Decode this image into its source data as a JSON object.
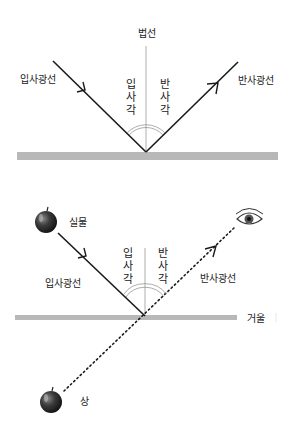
{
  "diagram_top": {
    "title": "Law of reflection",
    "normal_label": "법선",
    "incident_ray_label": "입사광선",
    "reflected_ray_label": "반사광선",
    "incident_angle_label": [
      "입",
      "사",
      "각"
    ],
    "reflected_angle_label": [
      "반",
      "사",
      "각"
    ]
  },
  "diagram_bottom": {
    "object_label": "실물",
    "image_label": "상",
    "incident_ray_label": "입사광선",
    "reflected_ray_label": "반사광선",
    "mirror_label": "거울",
    "incident_angle_label": [
      "입",
      "사",
      "각"
    ],
    "reflected_angle_label": [
      "반",
      "사",
      "각"
    ]
  },
  "colors": {
    "ray": "#1a1a1a",
    "normal": "#9a9a9a",
    "mirror": "#b8b8b8",
    "arc": "#8a8a8a",
    "apple": "#3a3a3a"
  }
}
